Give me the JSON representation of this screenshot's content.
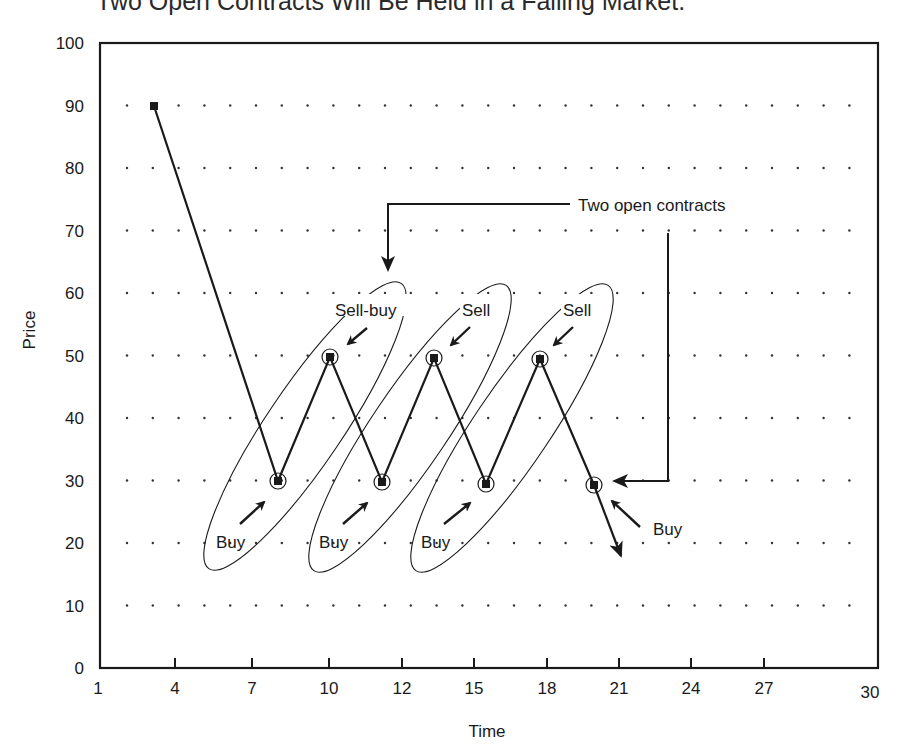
{
  "title": "Two Open Contracts Will Be Held in a Falling Market.",
  "chart_data": {
    "type": "line",
    "title": "Two Open Contracts Will Be Held in a Falling Market.",
    "xlabel": "Time",
    "ylabel": "Price",
    "ylim": [
      0,
      100
    ],
    "x_tick_labels": [
      "1",
      "4",
      "7",
      "10",
      "12",
      "15",
      "18",
      "21",
      "24",
      "27",
      "30"
    ],
    "y_tick_labels": [
      "0",
      "10",
      "20",
      "30",
      "40",
      "50",
      "60",
      "70",
      "80",
      "90",
      "100"
    ],
    "grid": "dotted",
    "series": [
      {
        "name": "Price path",
        "points": [
          {
            "x": 3.2,
            "y": 90
          },
          {
            "x": 8,
            "y": 30
          },
          {
            "x": 10,
            "y": 50
          },
          {
            "x": 12,
            "y": 30
          },
          {
            "x": 14,
            "y": 50
          },
          {
            "x": 16,
            "y": 30
          },
          {
            "x": 18,
            "y": 50
          },
          {
            "x": 20,
            "y": 30
          },
          {
            "x": 21,
            "y": 18
          }
        ]
      }
    ],
    "annotations": [
      {
        "text": "Sell-buy",
        "near": {
          "x": 10,
          "y": 50
        }
      },
      {
        "text": "Sell",
        "near": {
          "x": 14,
          "y": 50
        }
      },
      {
        "text": "Sell",
        "near": {
          "x": 18,
          "y": 50
        }
      },
      {
        "text": "Buy",
        "near": {
          "x": 8,
          "y": 30
        }
      },
      {
        "text": "Buy",
        "near": {
          "x": 12,
          "y": 30
        }
      },
      {
        "text": "Buy",
        "near": {
          "x": 16,
          "y": 30
        }
      },
      {
        "text": "Buy",
        "near": {
          "x": 20,
          "y": 30
        }
      },
      {
        "text": "Two open contracts",
        "points_to": [
          {
            "x": 11.5,
            "y": 62
          },
          {
            "x": 20,
            "y": 30
          }
        ]
      }
    ]
  },
  "labels": {
    "sell_buy": "Sell-buy",
    "sell": "Sell",
    "buy": "Buy",
    "two_open": "Two open contracts",
    "x_axis": "Time",
    "y_axis": "Price"
  }
}
